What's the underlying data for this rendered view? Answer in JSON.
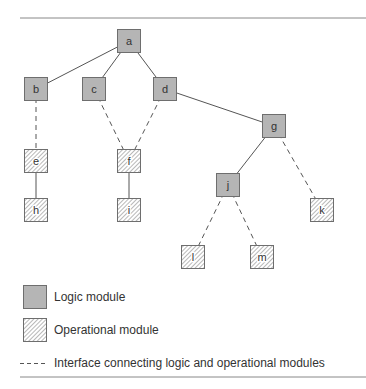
{
  "diagram": {
    "nodes": [
      {
        "id": "a",
        "label": "a",
        "type": "logic",
        "x": 117,
        "y": 29
      },
      {
        "id": "b",
        "label": "b",
        "type": "logic",
        "x": 24,
        "y": 77
      },
      {
        "id": "c",
        "label": "c",
        "type": "logic",
        "x": 82,
        "y": 77
      },
      {
        "id": "d",
        "label": "d",
        "type": "logic",
        "x": 153,
        "y": 77
      },
      {
        "id": "g",
        "label": "g",
        "type": "logic",
        "x": 262,
        "y": 114
      },
      {
        "id": "e",
        "label": "e",
        "type": "operational",
        "x": 24,
        "y": 149
      },
      {
        "id": "f",
        "label": "f",
        "type": "operational",
        "x": 117,
        "y": 149
      },
      {
        "id": "h",
        "label": "h",
        "type": "operational",
        "x": 24,
        "y": 198
      },
      {
        "id": "i",
        "label": "i",
        "type": "operational",
        "x": 117,
        "y": 198
      },
      {
        "id": "j",
        "label": "j",
        "type": "logic",
        "x": 216,
        "y": 173
      },
      {
        "id": "k",
        "label": "k",
        "type": "operational",
        "x": 310,
        "y": 198
      },
      {
        "id": "l",
        "label": "l",
        "type": "operational",
        "x": 181,
        "y": 245
      },
      {
        "id": "m",
        "label": "m",
        "type": "operational",
        "x": 250,
        "y": 245
      }
    ],
    "edges": [
      {
        "from": "a",
        "to": "b",
        "style": "solid"
      },
      {
        "from": "a",
        "to": "c",
        "style": "solid"
      },
      {
        "from": "a",
        "to": "d",
        "style": "solid"
      },
      {
        "from": "d",
        "to": "g",
        "style": "solid"
      },
      {
        "from": "b",
        "to": "e",
        "style": "dashed"
      },
      {
        "from": "c",
        "to": "f",
        "style": "dashed"
      },
      {
        "from": "d",
        "to": "f",
        "style": "dashed"
      },
      {
        "from": "e",
        "to": "h",
        "style": "solid"
      },
      {
        "from": "f",
        "to": "i",
        "style": "solid"
      },
      {
        "from": "g",
        "to": "j",
        "style": "solid"
      },
      {
        "from": "g",
        "to": "k",
        "style": "dashed"
      },
      {
        "from": "j",
        "to": "l",
        "style": "dashed"
      },
      {
        "from": "j",
        "to": "m",
        "style": "dashed"
      }
    ]
  },
  "legend": {
    "logic_label": "Logic module",
    "operational_label": "Operational module",
    "interface_label": "Interface connecting logic and operational modules"
  },
  "colors": {
    "logic_fill": "#b5b5b5",
    "border": "#6e6e6e",
    "line": "#555555",
    "rule": "#888888"
  }
}
